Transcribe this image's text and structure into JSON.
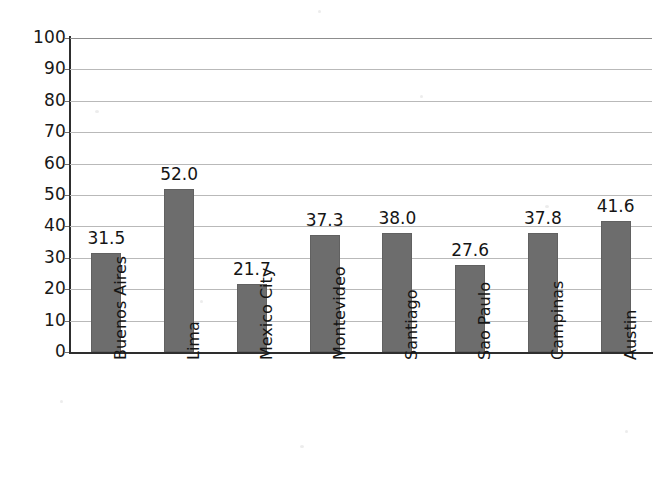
{
  "chart_data": {
    "type": "bar",
    "title": "",
    "subtitle": "",
    "xlabel": "",
    "ylabel": "",
    "categories": [
      "Buenos Aires",
      "Lima",
      "Mexico City",
      "Montevideo",
      "Santiago",
      "Sao Paulo",
      "Campinas",
      "Austin"
    ],
    "values": [
      31.5,
      52.0,
      21.7,
      37.3,
      38.0,
      27.6,
      37.8,
      41.6
    ],
    "value_labels": [
      "31.5",
      "52.0",
      "21.7",
      "37.3",
      "38.0",
      "27.6",
      "37.8",
      "41.6"
    ],
    "ylim": [
      0,
      100
    ],
    "ytick_values": [
      100,
      90,
      80,
      70,
      60,
      50,
      40,
      30,
      20,
      10,
      0
    ],
    "ytick_labels": [
      "100",
      "90",
      "80",
      "70",
      "60",
      "50",
      "40",
      "30",
      "20",
      "10",
      "0"
    ],
    "ytick_step": 10,
    "grid": true,
    "grid_axis": "y",
    "legend": false,
    "legend_position": "none",
    "bar_color": "#6d6d6d",
    "bar_edge_color": "#616161",
    "grid_color": "#b9b9b9",
    "axis_color": "#2e2e2e",
    "text_color": "#151515",
    "background_color": "#ffffff",
    "category_label_rotation": -90,
    "data_labels_shown": true,
    "data_label_position": "outside-end"
  }
}
